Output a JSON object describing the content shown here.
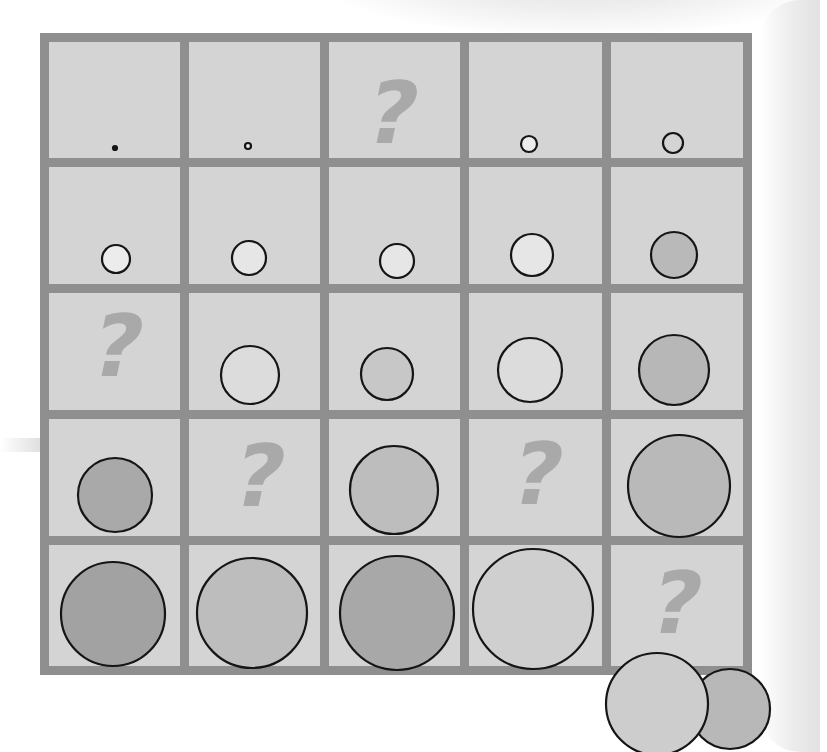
{
  "puzzle": {
    "rows": 5,
    "cols": 5,
    "frame": {
      "x": 40,
      "y": 33,
      "width": 712,
      "height": 642,
      "border": 9
    },
    "col_dividers": [
      180,
      320,
      460,
      602
    ],
    "row_dividers": [
      158,
      284,
      410,
      536
    ],
    "colors": {
      "cell_background": "#d4d4d4",
      "grid_border": "#8f8f8f",
      "question_mark": "#a9a9a9",
      "circle_stroke": "#151515",
      "fill_white": "#ececec",
      "fill_light": "#c9c9c9",
      "fill_medium": "#b4b4b4",
      "fill_dark": "#a3a3a3"
    },
    "question_mark_glyph": "?",
    "cells": [
      {
        "row": 1,
        "col": 1,
        "type": "circle",
        "cx": 115,
        "cy": 148,
        "r": 2,
        "fill": "#151515"
      },
      {
        "row": 1,
        "col": 2,
        "type": "circle",
        "cx": 248,
        "cy": 146,
        "r": 3,
        "fill": "#ececec"
      },
      {
        "row": 1,
        "col": 3,
        "type": "question",
        "cx": 393,
        "cy": 115
      },
      {
        "row": 1,
        "col": 4,
        "type": "circle",
        "cx": 529,
        "cy": 144,
        "r": 8,
        "fill": "#ececec"
      },
      {
        "row": 1,
        "col": 5,
        "type": "circle",
        "cx": 673,
        "cy": 143,
        "r": 10,
        "fill": "#d4d4d4"
      },
      {
        "row": 2,
        "col": 1,
        "type": "circle",
        "cx": 116,
        "cy": 259,
        "r": 14,
        "fill": "#ececec"
      },
      {
        "row": 2,
        "col": 2,
        "type": "circle",
        "cx": 249,
        "cy": 258,
        "r": 17,
        "fill": "#e6e6e6"
      },
      {
        "row": 2,
        "col": 3,
        "type": "circle",
        "cx": 397,
        "cy": 261,
        "r": 17,
        "fill": "#e6e6e6"
      },
      {
        "row": 2,
        "col": 4,
        "type": "circle",
        "cx": 532,
        "cy": 255,
        "r": 21,
        "fill": "#e6e6e6"
      },
      {
        "row": 2,
        "col": 5,
        "type": "circle",
        "cx": 674,
        "cy": 255,
        "r": 23,
        "fill": "#b9b9b9"
      },
      {
        "row": 3,
        "col": 1,
        "type": "question",
        "cx": 118,
        "cy": 348
      },
      {
        "row": 3,
        "col": 2,
        "type": "circle",
        "cx": 250,
        "cy": 375,
        "r": 29,
        "fill": "#dcdcdc"
      },
      {
        "row": 3,
        "col": 3,
        "type": "circle",
        "cx": 387,
        "cy": 374,
        "r": 26,
        "fill": "#c7c7c7"
      },
      {
        "row": 3,
        "col": 4,
        "type": "circle",
        "cx": 530,
        "cy": 370,
        "r": 32,
        "fill": "#dcdcdc"
      },
      {
        "row": 3,
        "col": 5,
        "type": "circle",
        "cx": 674,
        "cy": 370,
        "r": 35,
        "fill": "#b7b7b7"
      },
      {
        "row": 4,
        "col": 1,
        "type": "circle",
        "cx": 115,
        "cy": 495,
        "r": 37,
        "fill": "#a9a9a9"
      },
      {
        "row": 4,
        "col": 2,
        "type": "question",
        "cx": 260,
        "cy": 478
      },
      {
        "row": 4,
        "col": 3,
        "type": "circle",
        "cx": 394,
        "cy": 490,
        "r": 44,
        "fill": "#bdbdbd"
      },
      {
        "row": 4,
        "col": 4,
        "type": "question",
        "cx": 538,
        "cy": 476
      },
      {
        "row": 4,
        "col": 5,
        "type": "circle",
        "cx": 679,
        "cy": 486,
        "r": 51,
        "fill": "#b9b9b9"
      },
      {
        "row": 5,
        "col": 1,
        "type": "circle",
        "cx": 113,
        "cy": 614,
        "r": 52,
        "fill": "#a2a2a2"
      },
      {
        "row": 5,
        "col": 2,
        "type": "circle",
        "cx": 252,
        "cy": 613,
        "r": 55,
        "fill": "#bdbdbd"
      },
      {
        "row": 5,
        "col": 3,
        "type": "circle",
        "cx": 397,
        "cy": 613,
        "r": 57,
        "fill": "#a8a8a8"
      },
      {
        "row": 5,
        "col": 4,
        "type": "circle",
        "cx": 533,
        "cy": 609,
        "r": 60,
        "fill": "#cfcfcf"
      },
      {
        "row": 5,
        "col": 5,
        "type": "question",
        "cx": 677,
        "cy": 605
      }
    ],
    "answer_options": [
      {
        "name": "option-circle-large",
        "cx": 657,
        "cy": 704,
        "r": 51,
        "fill": "#cdcdcd"
      },
      {
        "name": "option-circle-small",
        "cx": 730,
        "cy": 709,
        "r": 40,
        "fill": "#b8b8b8"
      }
    ]
  }
}
